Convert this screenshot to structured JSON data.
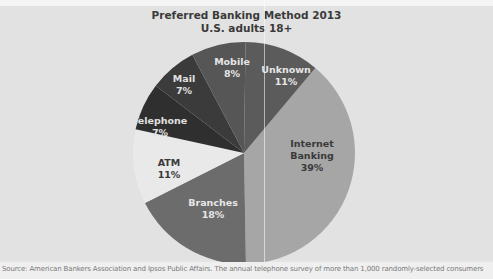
{
  "header": {
    "title": "Preferred Banking Method 2013",
    "subtitle": "U.S. adults 18+"
  },
  "caption": "Source: American Bankers Association and Ipsos Public Affairs. The annual telephone survey of more than 1,000 randomly-selected consumers",
  "colors": {
    "background": "#e2e2e2",
    "internet_banking": "#a6a6a6",
    "branches": "#6c6c6c",
    "atm": "#e9e9e9",
    "telephone": "#2f2f2f",
    "mail": "#3b3b3b",
    "mobile": "#565656",
    "unknown": "#5b5b5b"
  },
  "chart_data": {
    "type": "pie",
    "title": "Preferred Banking Method 2013",
    "subtitle": "U.S. adults 18+",
    "categories": [
      "Internet Banking",
      "Branches",
      "ATM",
      "Telephone",
      "Mail",
      "Mobile",
      "Unknown"
    ],
    "values": [
      39,
      18,
      11,
      7,
      7,
      8,
      11
    ],
    "unit": "%",
    "start_angle_deg_clockwise_from_top": 40,
    "direction": "clockwise",
    "legend": "none (labels inside slices)",
    "slices": [
      {
        "label": "Internet Banking",
        "value": 39,
        "display": "39%",
        "color": "#a6a6a6",
        "text_color": "#3a3a3a",
        "label_lines": [
          "Internet",
          "Banking",
          "39%"
        ]
      },
      {
        "label": "Branches",
        "value": 18,
        "display": "18%",
        "color": "#6c6c6c",
        "text_color": "#e6e6e6",
        "label_lines": [
          "Branches",
          "18%"
        ]
      },
      {
        "label": "ATM",
        "value": 11,
        "display": "11%",
        "color": "#e9e9e9",
        "text_color": "#3a3a3a",
        "label_lines": [
          "ATM",
          "11%"
        ]
      },
      {
        "label": "Telephone",
        "value": 7,
        "display": "7%",
        "color": "#2f2f2f",
        "text_color": "#e0e0e0",
        "label_lines": [
          "Telephone",
          "7%"
        ]
      },
      {
        "label": "Mail",
        "value": 7,
        "display": "7%",
        "color": "#3b3b3b",
        "text_color": "#e0e0e0",
        "label_lines": [
          "Mail",
          "7%"
        ]
      },
      {
        "label": "Mobile",
        "value": 8,
        "display": "8%",
        "color": "#565656",
        "text_color": "#e6e6e6",
        "label_lines": [
          "Mobile",
          "8%"
        ]
      },
      {
        "label": "Unknown",
        "value": 11,
        "display": "11%",
        "color": "#5b5b5b",
        "text_color": "#e6e6e6",
        "label_lines": [
          "Unknown",
          "11%"
        ]
      }
    ],
    "label_positions": [
      {
        "x": 312,
        "y": 156
      },
      {
        "x": 213,
        "y": 209
      },
      {
        "x": 169,
        "y": 169
      },
      {
        "x": 160,
        "y": 127
      },
      {
        "x": 184,
        "y": 85
      },
      {
        "x": 232,
        "y": 68
      },
      {
        "x": 286,
        "y": 76
      }
    ]
  }
}
